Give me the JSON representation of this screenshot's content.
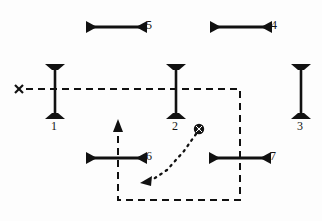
{
  "diagram": {
    "background_color": "#fdfdfd",
    "ink_color": "#111111",
    "bars": [
      {
        "id": "5",
        "label": "5",
        "orientation": "horizontal",
        "x1": 88,
        "y1": 27,
        "x2": 145,
        "y2": 27,
        "label_x": 146,
        "label_y": 19
      },
      {
        "id": "4",
        "label": "4",
        "orientation": "horizontal",
        "x1": 212,
        "y1": 27,
        "x2": 270,
        "y2": 27,
        "label_x": 271,
        "label_y": 19
      },
      {
        "id": "1",
        "label": "1",
        "orientation": "vertical",
        "x1": 55,
        "y1": 64,
        "x2": 55,
        "y2": 119,
        "label_x": 51,
        "label_y": 120
      },
      {
        "id": "2",
        "label": "2",
        "orientation": "vertical",
        "x1": 176,
        "y1": 64,
        "x2": 176,
        "y2": 119,
        "label_x": 172,
        "label_y": 120
      },
      {
        "id": "3",
        "label": "3",
        "orientation": "vertical",
        "x1": 301,
        "y1": 64,
        "x2": 301,
        "y2": 119,
        "label_x": 297,
        "label_y": 120
      },
      {
        "id": "6",
        "label": "6",
        "orientation": "horizontal",
        "x1": 88,
        "y1": 158,
        "x2": 145,
        "y2": 158,
        "label_x": 146,
        "label_y": 150
      },
      {
        "id": "7",
        "label": "7",
        "orientation": "horizontal",
        "x1": 211,
        "y1": 158,
        "x2": 269,
        "y2": 158,
        "label_x": 270,
        "label_y": 150
      }
    ],
    "markers": [
      {
        "name": "x-start-marker",
        "symbol": "x",
        "x": 20,
        "y": 89
      },
      {
        "name": "ball-marker",
        "symbol": "ball",
        "x": 199,
        "y": 129,
        "radius": 5
      }
    ],
    "dashed_path": {
      "name": "dashed-route",
      "points": "24,89 240,89 240,200 118,200 118,127",
      "dash": "7,5",
      "stroke_width": 2,
      "arrow_end": "up"
    },
    "dotted_path": {
      "name": "dotted-trajectory",
      "points": "196,133 183,150 166,170 148,181",
      "dash": "1.6,5",
      "stroke_width": 2.2,
      "arrow_end": "lower-left"
    }
  }
}
